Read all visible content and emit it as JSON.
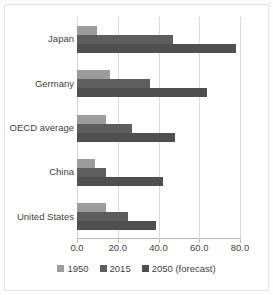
{
  "chart_data": {
    "type": "bar",
    "orientation": "horizontal",
    "title": "",
    "xlabel": "",
    "ylabel": "",
    "xlim": [
      0,
      80
    ],
    "xticks": [
      "0.0",
      "20.0",
      "40.0",
      "60.0",
      "80.0"
    ],
    "xtick_values": [
      0,
      20,
      40,
      60,
      80
    ],
    "grid": true,
    "legend_position": "bottom",
    "categories": [
      "Japan",
      "Germany",
      "OECD average",
      "China",
      "United States"
    ],
    "series": [
      {
        "name": "1950",
        "color": "#9c9c9c",
        "values": [
          10,
          16,
          14,
          9,
          14
        ]
      },
      {
        "name": "2015",
        "color": "#5e5e5e",
        "values": [
          47,
          36,
          27,
          14,
          25
        ]
      },
      {
        "name": "2050 (forecast)",
        "color": "#4f4f4f",
        "values": [
          78,
          64,
          48,
          42,
          39
        ]
      }
    ]
  },
  "legend": {
    "items": [
      {
        "label": "1950"
      },
      {
        "label": "2015"
      },
      {
        "label": "2050 (forecast)"
      }
    ]
  },
  "axis": {
    "x_tick_labels": [
      "0.0",
      "20.0",
      "40.0",
      "60.0",
      "80.0"
    ]
  },
  "categories": {
    "labels": [
      "Japan",
      "Germany",
      "OECD average",
      "China",
      "United States"
    ]
  }
}
